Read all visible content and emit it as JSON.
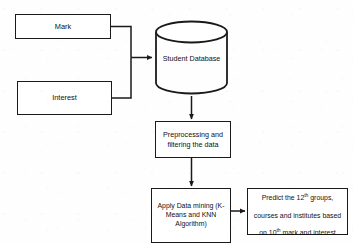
{
  "diagram": {
    "type": "flowchart",
    "background_color": "#fefefe",
    "stroke_color": "#1a1a1a",
    "text_color": "#111111",
    "nodes": {
      "mark": {
        "label": "Mark",
        "shape": "rectangle"
      },
      "interest": {
        "label": "Interest",
        "shape": "rectangle"
      },
      "database": {
        "label": "Student Database",
        "shape": "cylinder"
      },
      "preprocess": {
        "label": "Preprocessing and\nfiltering the data",
        "shape": "rectangle"
      },
      "mining": {
        "label": "Apply Data mining (K-\nMeans and KNN\nAlgorithm)",
        "shape": "rectangle"
      },
      "predict": {
        "line1": "Predict the 12",
        "line1_sup": "th",
        "line1_rest": " groups,",
        "line2": "courses and institutes based",
        "line3_pre": "on 10",
        "line3_sup": "th",
        "line3_rest": " mark and interest",
        "shape": "rectangle"
      }
    },
    "edges": [
      {
        "from": "mark",
        "to": "database",
        "style": "orthogonal-arrow"
      },
      {
        "from": "interest",
        "to": "database",
        "style": "orthogonal-arrow"
      },
      {
        "from": "database",
        "to": "preprocess",
        "style": "vertical-arrow"
      },
      {
        "from": "preprocess",
        "to": "mining",
        "style": "vertical-arrow"
      },
      {
        "from": "mining",
        "to": "predict",
        "style": "horizontal-arrow"
      }
    ]
  }
}
